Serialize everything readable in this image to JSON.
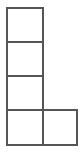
{
  "figure": {
    "name": "L-shaped polyomino grid",
    "canvas": {
      "width": 84,
      "height": 152,
      "background_color": "#ffffff"
    },
    "style": {
      "line_color": "#555555",
      "line_width_px": 2,
      "cell_fill_color": "#ffffff"
    },
    "geometry": {
      "cell_size_px": 36,
      "columns": 2,
      "rows": 4,
      "origin_x": 6,
      "origin_y": 7
    },
    "cells": [
      {
        "id": "cell-r1c1",
        "row": 1,
        "col": 1,
        "x": 6,
        "y": 7,
        "w": 38,
        "h": 36
      },
      {
        "id": "cell-r2c1",
        "row": 2,
        "col": 1,
        "x": 6,
        "y": 41,
        "w": 38,
        "h": 36
      },
      {
        "id": "cell-r3c1",
        "row": 3,
        "col": 1,
        "x": 6,
        "y": 75,
        "w": 38,
        "h": 36
      },
      {
        "id": "cell-r4c1",
        "row": 4,
        "col": 1,
        "x": 6,
        "y": 109,
        "w": 38,
        "h": 37
      },
      {
        "id": "cell-r4c2",
        "row": 4,
        "col": 2,
        "x": 42,
        "y": 109,
        "w": 36,
        "h": 37
      }
    ]
  }
}
